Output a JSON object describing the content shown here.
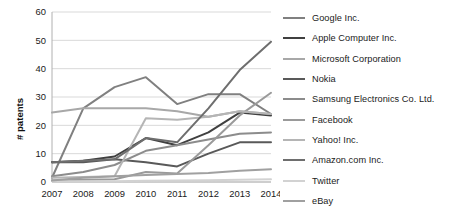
{
  "chart_data": {
    "type": "line",
    "title": "",
    "xlabel": "",
    "ylabel": "# patents",
    "x": [
      2007,
      2008,
      2009,
      2010,
      2011,
      2012,
      2013,
      2014
    ],
    "categories": [
      "2007",
      "2008",
      "2009",
      "2010",
      "2011",
      "2012",
      "2013",
      "2014"
    ],
    "ylim": [
      0,
      60
    ],
    "yticks": [
      0,
      10,
      20,
      30,
      40,
      50,
      60
    ],
    "ytick_labels": [
      "0",
      "10",
      "20",
      "30",
      "40",
      "50",
      "60"
    ],
    "grid": true,
    "grid_axis": "y",
    "legend_position": "right",
    "series": [
      {
        "name": "Google Inc.",
        "color": "#808080",
        "values": [
          1.5,
          26,
          33.5,
          37,
          27.5,
          31,
          31,
          24
        ]
      },
      {
        "name": "Apple Computer Inc.",
        "color": "#404040",
        "values": [
          7,
          7.5,
          9,
          15.5,
          13,
          17.5,
          24.5,
          23.5
        ]
      },
      {
        "name": "Microsoft Corporation",
        "color": "#a8a8a8",
        "values": [
          24.5,
          26,
          26,
          26,
          25,
          23,
          25,
          24
        ]
      },
      {
        "name": "Nokia",
        "color": "#595959",
        "values": [
          7,
          7,
          8,
          7,
          5.5,
          10,
          14,
          14
        ]
      },
      {
        "name": "Samsung Electronics Co. Ltd.",
        "color": "#8c8c8c",
        "values": [
          2,
          3.5,
          6,
          11,
          13,
          15,
          17,
          17.5
        ]
      },
      {
        "name": "Facebook",
        "color": "#9a9a9a",
        "values": [
          0.5,
          0.8,
          1,
          3.5,
          3,
          13,
          23.5,
          31.5
        ]
      },
      {
        "name": "Yahoo! Inc.",
        "color": "#b5b5b5",
        "values": [
          1.5,
          1.8,
          2,
          22.5,
          22,
          23,
          25,
          24
        ]
      },
      {
        "name": "Amazon.com Inc.",
        "color": "#6e6e6e",
        "values": [
          7,
          7.5,
          8,
          15.5,
          14,
          26,
          39.5,
          49.5
        ]
      },
      {
        "name": "Twitter",
        "color": "#d2d2d2",
        "values": [
          0.3,
          0.3,
          0.3,
          0.4,
          0.5,
          0.6,
          0.8,
          1
        ]
      },
      {
        "name": "eBay",
        "color": "#a0a0a0",
        "values": [
          0.5,
          1.5,
          2,
          2.5,
          2.8,
          3.2,
          4,
          4.5
        ]
      }
    ]
  },
  "legend": {
    "items": [
      {
        "label": "Google Inc."
      },
      {
        "label": "Apple Computer Inc."
      },
      {
        "label": "Microsoft Corporation"
      },
      {
        "label": "Nokia"
      },
      {
        "label": "Samsung Electronics Co. Ltd."
      },
      {
        "label": "Facebook"
      },
      {
        "label": "Yahoo! Inc."
      },
      {
        "label": "Amazon.com Inc."
      },
      {
        "label": "Twitter"
      },
      {
        "label": "eBay"
      }
    ]
  }
}
